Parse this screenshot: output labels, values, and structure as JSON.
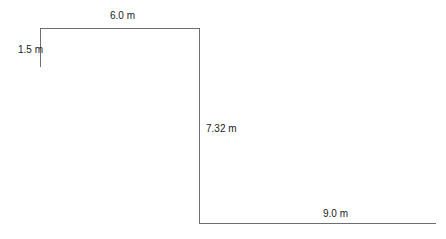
{
  "diagram": {
    "type": "stepped-profile dimension drawing",
    "segments": [
      {
        "id": "left-rise",
        "orientation": "vertical",
        "label": "1.5 m"
      },
      {
        "id": "top-run",
        "orientation": "horizontal",
        "label": "6.0 m"
      },
      {
        "id": "drop",
        "orientation": "vertical",
        "label": "7.32 m"
      },
      {
        "id": "bottom-run",
        "orientation": "horizontal",
        "label": "9.0 m"
      }
    ],
    "line_color": "#6e6e6e",
    "text_color": "#1a1a1a"
  }
}
